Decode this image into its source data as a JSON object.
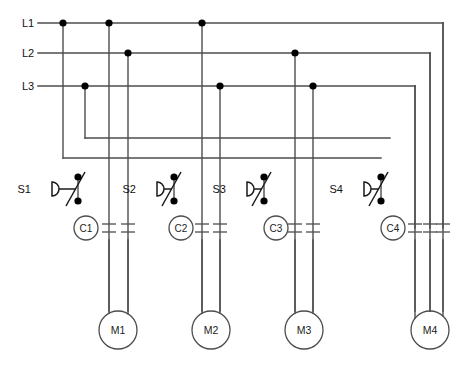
{
  "diagram": {
    "type": "electrical-schematic",
    "canvas": {
      "width": 473,
      "height": 368
    },
    "colors": {
      "wire": "#4d4d4d",
      "node": "#000000",
      "component": "#4d4d4d",
      "label": "#111111",
      "background": "#ffffff"
    }
  },
  "buses": [
    {
      "id": "L1",
      "label": "L1",
      "y": 23,
      "x_start": 38,
      "x_end": 443,
      "junction_x": [
        63,
        109,
        202
      ],
      "turn_down_x": 443
    },
    {
      "id": "L2",
      "label": "L2",
      "y": 53,
      "x_start": 38,
      "x_end": 430,
      "junction_x": [
        128,
        295
      ],
      "turn_down_x": 430
    },
    {
      "id": "L3",
      "label": "L3",
      "y": 86,
      "x_start": 38,
      "x_end": 415,
      "junction_x": [
        85,
        220,
        313
      ],
      "turn_down_x": 415
    }
  ],
  "control_rails": [
    {
      "id": "rail-upper",
      "y": 138,
      "x_start": 85,
      "x_end": 390,
      "source_bus": "L3"
    },
    {
      "id": "rail-lower",
      "y": 158,
      "x_start": 63,
      "x_end": 381,
      "source_bus": "L1"
    }
  ],
  "switches": [
    {
      "id": "S1",
      "label": "S1",
      "label_x": 31,
      "label_y": 187,
      "symbol_x": 52,
      "stem_x": 78,
      "node_top_y": 177,
      "node_bottom_y": 201,
      "rail": "rail-lower"
    },
    {
      "id": "S2",
      "label": "S2",
      "label_x": 136,
      "label_y": 187,
      "symbol_x": 157,
      "stem_x": 174,
      "node_top_y": 177,
      "node_bottom_y": 201,
      "rail": "rail-lower"
    },
    {
      "id": "S3",
      "label": "S3",
      "label_x": 226,
      "label_y": 187,
      "symbol_x": 247,
      "stem_x": 264,
      "node_top_y": 177,
      "node_bottom_y": 201,
      "rail": "rail-lower"
    },
    {
      "id": "S4",
      "label": "S4",
      "label_x": 343,
      "label_y": 187,
      "symbol_x": 364,
      "stem_x": 381,
      "node_top_y": 177,
      "node_bottom_y": 201,
      "rail": "rail-lower"
    }
  ],
  "contactor_coils": [
    {
      "id": "C1",
      "label": "C1",
      "cx": 86,
      "cy": 228,
      "r": 12
    },
    {
      "id": "C2",
      "label": "C2",
      "cx": 181,
      "cy": 228,
      "r": 12
    },
    {
      "id": "C3",
      "label": "C3",
      "cx": 276,
      "cy": 228,
      "r": 12
    },
    {
      "id": "C4",
      "label": "C4",
      "cx": 393,
      "cy": 228,
      "r": 12
    }
  ],
  "contacts": [
    {
      "id": "C1-contact-A",
      "coil": "C1",
      "x": 109,
      "y": 228
    },
    {
      "id": "C1-contact-B",
      "coil": "C1",
      "x": 128,
      "y": 228
    },
    {
      "id": "C2-contact-A",
      "coil": "C2",
      "x": 202,
      "y": 228
    },
    {
      "id": "C2-contact-B",
      "coil": "C2",
      "x": 220,
      "y": 228
    },
    {
      "id": "C3-contact-A",
      "coil": "C3",
      "x": 295,
      "y": 228
    },
    {
      "id": "C3-contact-B",
      "coil": "C3",
      "x": 313,
      "y": 228
    },
    {
      "id": "C4-contact-A",
      "coil": "C4",
      "x": 415,
      "y": 228
    },
    {
      "id": "C4-contact-B",
      "coil": "C4",
      "x": 430,
      "y": 228
    },
    {
      "id": "C4-contact-C",
      "coil": "C4",
      "x": 443,
      "y": 228
    }
  ],
  "motors": [
    {
      "id": "M1",
      "label": "M1",
      "cx": 118,
      "cy": 330,
      "r": 19,
      "feed_x": [
        109,
        128
      ],
      "phases": [
        "L1",
        "L2"
      ]
    },
    {
      "id": "M2",
      "label": "M2",
      "cx": 211,
      "cy": 330,
      "r": 19,
      "feed_x": [
        202,
        220
      ],
      "phases": [
        "L1",
        "L3"
      ]
    },
    {
      "id": "M3",
      "label": "M3",
      "cx": 304,
      "cy": 330,
      "r": 19,
      "feed_x": [
        295,
        313
      ],
      "phases": [
        "L2",
        "L3"
      ]
    },
    {
      "id": "M4",
      "label": "M4",
      "cx": 430,
      "cy": 330,
      "r": 19,
      "feed_x": [
        415,
        430,
        443
      ],
      "phases": [
        "L3",
        "L2",
        "L1"
      ]
    }
  ],
  "verticals": [
    {
      "id": "drop-L1-to-rail-lower",
      "x": 63,
      "y_start": 23,
      "y_end": 158
    },
    {
      "id": "drop-L3-to-rail-upper",
      "x": 85,
      "y_start": 86,
      "y_end": 138
    },
    {
      "id": "drop-L1-to-C1-contact-A",
      "x": 109,
      "y_start": 23,
      "y_end": 311
    },
    {
      "id": "drop-L2-to-C1-contact-B",
      "x": 128,
      "y_start": 53,
      "y_end": 311
    },
    {
      "id": "drop-L1-to-C2-contact-A",
      "x": 202,
      "y_start": 23,
      "y_end": 311
    },
    {
      "id": "drop-L3-to-C2-contact-B",
      "x": 220,
      "y_start": 86,
      "y_end": 311
    },
    {
      "id": "drop-L2-to-C3-contact-A",
      "x": 295,
      "y_start": 53,
      "y_end": 311
    },
    {
      "id": "drop-L3-to-C3-contact-B",
      "x": 313,
      "y_start": 86,
      "y_end": 311
    },
    {
      "id": "drop-L3-to-C4-contact-A",
      "x": 415,
      "y_start": 86,
      "y_end": 311
    },
    {
      "id": "drop-L2-to-C4-contact-B",
      "x": 430,
      "y_start": 53,
      "y_end": 311
    },
    {
      "id": "drop-L1-to-C4-contact-C",
      "x": 443,
      "y_start": 23,
      "y_end": 311
    }
  ]
}
